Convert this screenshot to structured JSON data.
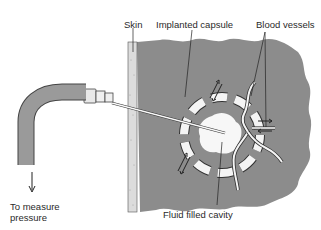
{
  "labels": {
    "skin": "Skin",
    "implanted_capsule": "Implanted capsule",
    "blood_vessels": "Blood vessels",
    "to_measure_line1": "To measure",
    "to_measure_line2": "pressure",
    "fluid_filled_cavity": "Fluid filled cavity"
  },
  "colors": {
    "tissue": "#8c8c8c",
    "skin": "#dcdcdc",
    "tube": "#9a9a9a",
    "capsule_segment": "#f4f4f4",
    "cavity": "#f7f7f7",
    "line": "#333333"
  }
}
